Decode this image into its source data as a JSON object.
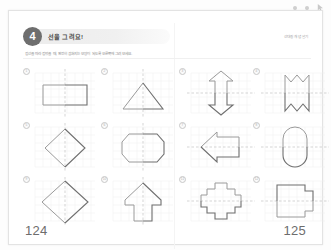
{
  "viewer": {
    "marks": [
      "dot",
      "dot",
      "cursor-arrow"
    ]
  },
  "worksheet": {
    "chapter_number": "4",
    "unit_title": "선을 그려요!",
    "unit_meta": "선대칭 개념 알기",
    "instruction": "점선을 따라 접었을 때, 완전히 겹쳐지는 모양이 되도록 오른쪽에 그려 보세요.",
    "page_left": "124",
    "page_right": "125",
    "accent_color": "#6e6e6e",
    "grid_line_color": "#e6e6e6",
    "axis_color": "#bdbdbd",
    "shape_color": "#8a8a8a"
  },
  "exercises": [
    {
      "marker": "1",
      "shape_name": "rectangle-half",
      "axis": "vertical",
      "description": "직사각형의 왼쪽 절반"
    },
    {
      "marker": "2",
      "shape_name": "triangle-half",
      "axis": "vertical",
      "description": "삼각형의 왼쪽 절반"
    },
    {
      "marker": "3",
      "shape_name": "double-arrow",
      "axis": "horizontal",
      "description": "위아래 화살표의 위쪽 절반"
    },
    {
      "marker": "4",
      "shape_name": "zigzag-banner",
      "axis": "horizontal",
      "description": "지그재그 깃발의 위쪽 절반"
    },
    {
      "marker": "5",
      "shape_name": "diamond",
      "axis": "vertical",
      "description": "마름모의 왼쪽 절반"
    },
    {
      "marker": "6",
      "shape_name": "octagon",
      "axis": "vertical",
      "description": "팔각형의 왼쪽 절반"
    },
    {
      "marker": "7",
      "shape_name": "arrow-pentagon",
      "axis": "horizontal",
      "description": "화살표 오각형의 위쪽 절반"
    },
    {
      "marker": "8",
      "shape_name": "capsule",
      "axis": "horizontal",
      "description": "캡슐 모양의 위쪽 절반"
    },
    {
      "marker": "9",
      "shape_name": "diamond-large",
      "axis": "vertical",
      "description": "큰 마름모의 왼쪽 절반"
    },
    {
      "marker": "10",
      "shape_name": "house-arrow",
      "axis": "vertical",
      "description": "집 모양 화살표의 왼쪽 절반"
    },
    {
      "marker": "11",
      "shape_name": "stepped-cross",
      "axis": "horizontal",
      "description": "계단 십자 모양의 위쪽 절반"
    },
    {
      "marker": "12",
      "shape_name": "stepped-rectangle",
      "axis": "horizontal",
      "description": "계단 사각형의 위쪽 절반"
    }
  ]
}
